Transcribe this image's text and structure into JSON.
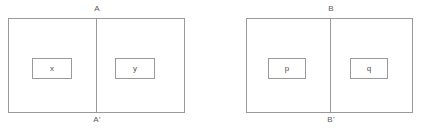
{
  "figures": [
    {
      "id": "figure-left",
      "axis_top_label": "A",
      "axis_bottom_label": "A'",
      "left_cell_label": "x",
      "right_cell_label": "y"
    },
    {
      "id": "figure-right",
      "axis_top_label": "B",
      "axis_bottom_label": "B'",
      "left_cell_label": "p",
      "right_cell_label": "q"
    }
  ],
  "style": {
    "line_color": "#9a9a9a",
    "text_color": "#4f4f4f",
    "background": "#ffffff"
  }
}
